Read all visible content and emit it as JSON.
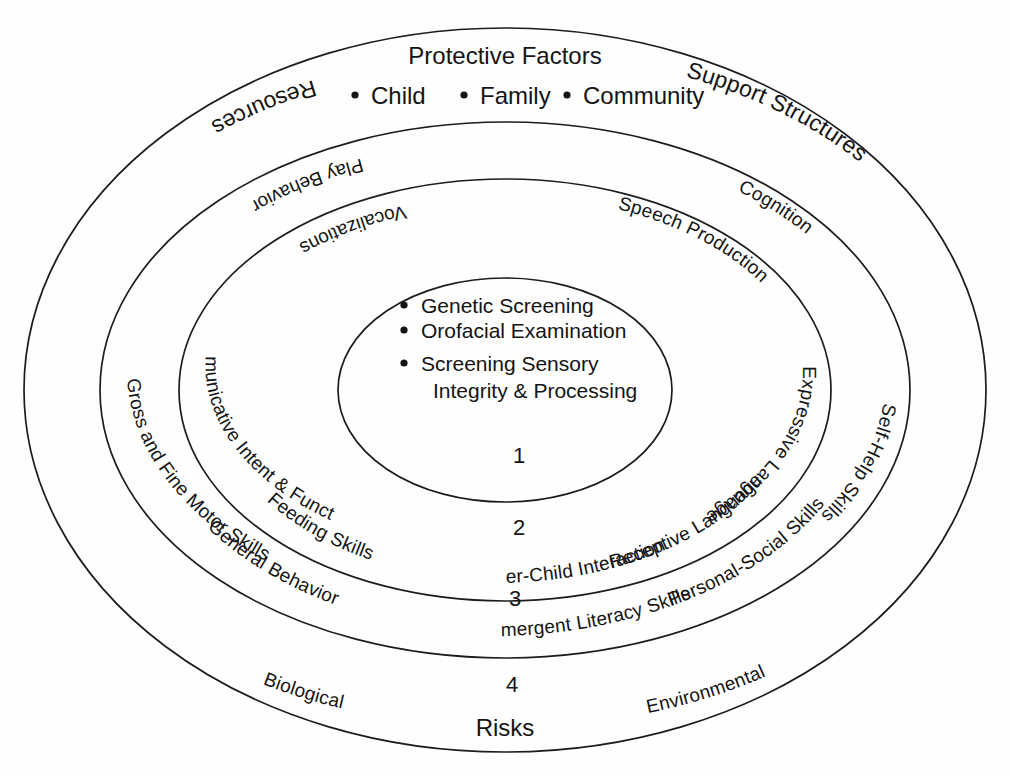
{
  "diagram": {
    "title": "Protective Factors",
    "top_bullets": [
      "Child",
      "Family",
      "Community"
    ],
    "bottom_title": "Risks",
    "ring_numbers": [
      "1",
      "2",
      "3",
      "4"
    ],
    "core": {
      "items": [
        "Genetic Screening",
        "Orofacial Examination",
        "Screening Sensory",
        "Integrity & Processing"
      ]
    },
    "ring2_labels": [
      "Communicative Intent & Functions",
      "Vocalizations",
      "Speech Production",
      "Expressive Language",
      "Receptive Language",
      "Mother-Child Interaction",
      "Feeding Skills"
    ],
    "ring3_labels": [
      "Gross and Fine Motor Skills",
      "Play Behavior",
      "Cognition",
      "Self-Help Skills",
      "Personal-Social Skills",
      "Emergent Literacy Skills",
      "General Behavior"
    ],
    "ring4_labels": [
      "Resources",
      "Support Structures",
      "Biological",
      "Environmental"
    ],
    "colors": {
      "stroke": "#1c1c1c",
      "text": "#141414",
      "background": "#fefefe"
    }
  }
}
